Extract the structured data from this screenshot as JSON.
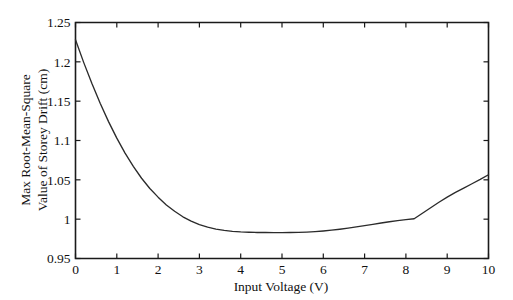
{
  "chart_data": {
    "type": "line",
    "title": "",
    "xlabel": "Input Voltage (V)",
    "ylabel": "Max Root-Mean-Square Value of Storey Drift (cm)",
    "ylabel_line1": "Max Root-Mean-Square",
    "ylabel_line2": "Value of Storey Drift (cm)",
    "xlim": [
      0,
      10
    ],
    "ylim": [
      0.95,
      1.25
    ],
    "grid": false,
    "legend": null,
    "xticks": [
      0,
      1,
      2,
      3,
      4,
      5,
      6,
      7,
      8,
      9,
      10
    ],
    "xtick_labels": [
      "0",
      "1",
      "2",
      "3",
      "4",
      "5",
      "6",
      "7",
      "8",
      "9",
      "10"
    ],
    "yticks": [
      0.95,
      1.0,
      1.05,
      1.1,
      1.15,
      1.2,
      1.25
    ],
    "ytick_labels": [
      "0.95",
      "1",
      "1.05",
      "1.1",
      "1.15",
      "1.2",
      "1.25"
    ],
    "series": [
      {
        "name": "Max RMS storey drift",
        "color": "#2b2b2b",
        "x": [
          0.0,
          0.2,
          0.4,
          0.6,
          0.8,
          1.0,
          1.2,
          1.4,
          1.6,
          1.8,
          2.0,
          2.2,
          2.4,
          2.6,
          2.8,
          3.0,
          3.2,
          3.4,
          3.6,
          3.8,
          4.0,
          4.2,
          4.4,
          4.6,
          4.8,
          5.0,
          5.2,
          5.4,
          5.6,
          5.8,
          6.0,
          6.2,
          6.4,
          6.6,
          6.8,
          7.0,
          7.2,
          7.4,
          7.6,
          7.8,
          8.0,
          8.2,
          8.4,
          8.6,
          8.8,
          9.0,
          9.2,
          9.4,
          9.6,
          9.8,
          10.0
        ],
        "y": [
          1.228,
          1.199,
          1.172,
          1.147,
          1.124,
          1.103,
          1.084,
          1.067,
          1.052,
          1.039,
          1.028,
          1.018,
          1.01,
          1.003,
          0.9975,
          0.993,
          0.9898,
          0.9874,
          0.9857,
          0.9845,
          0.9838,
          0.9834,
          0.9831,
          0.983,
          0.9829,
          0.9829,
          0.983,
          0.9832,
          0.9836,
          0.9842,
          0.985,
          0.986,
          0.9872,
          0.9886,
          0.9901,
          0.9917,
          0.9934,
          0.9951,
          0.9967,
          0.9982,
          0.9995,
          1.0005,
          1.0075,
          1.0145,
          1.0215,
          1.028,
          1.034,
          1.0395,
          1.045,
          1.0505,
          1.0565
        ]
      }
    ],
    "annotations": {
      "minimum_value": 0.983,
      "minimum_x": 5.0,
      "start_value": 1.228,
      "end_value": 1.057,
      "kink_x": 8.2
    }
  },
  "figure": {
    "background_color": "#ffffff",
    "axis_color": "#1a1a1a",
    "curve_color": "#2b2b2b"
  }
}
